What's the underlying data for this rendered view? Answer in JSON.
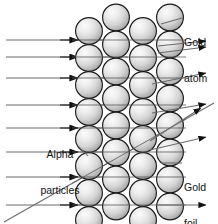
{
  "diagram": {
    "labels": {
      "gold_atom": {
        "line1": "Gold",
        "line2": "atom"
      },
      "gold_foil": {
        "line1": "Gold",
        "line2": "foil"
      },
      "alpha_particles": {
        "line1": "Alpha",
        "line2": "particles"
      }
    },
    "colors": {
      "sphere_outline": "#1a1a1a",
      "sphere_light": "#f2f2f2",
      "sphere_mid": "#d0d0d0",
      "sphere_dark": "#8f8f8f",
      "ray": "#6b6b6b",
      "arrowhead": "#111111",
      "text": "#111111",
      "background": "#ffffff"
    },
    "foil": {
      "columns": 4,
      "sphere_diameter": 27,
      "column_x_centers": [
        89,
        116,
        143,
        170
      ],
      "column_offset_rows": [
        0,
        1,
        0,
        1
      ],
      "row_spacing": 27,
      "first_row_center_y": 31
    },
    "incoming_rays": {
      "count": 8,
      "description": "horizontal alpha particle beams entering from the left",
      "y_positions": [
        40,
        57,
        78,
        105,
        128,
        152,
        177,
        205
      ],
      "x_start": 6,
      "x_end": 128,
      "arrowhead_x": 78
    },
    "outgoing_rays": {
      "count": 7,
      "description": "alpha particles exiting the foil, mostly undeflected with some deflected",
      "items": [
        {
          "name": "undeflected-top",
          "x1": 158,
          "y1": 46,
          "x2": 214,
          "y2": 41
        },
        {
          "name": "undeflected-upper",
          "x1": 158,
          "y1": 52,
          "x2": 214,
          "y2": 46
        },
        {
          "name": "deflected-slight-1",
          "x1": 158,
          "y1": 84,
          "x2": 214,
          "y2": 73
        },
        {
          "name": "deflected-slight-2",
          "x1": 158,
          "y1": 113,
          "x2": 214,
          "y2": 104
        },
        {
          "name": "deflected-upward",
          "x1": 154,
          "y1": 141,
          "x2": 214,
          "y2": 103
        },
        {
          "name": "deflected-slight-3",
          "x1": 154,
          "y1": 149,
          "x2": 214,
          "y2": 137
        },
        {
          "name": "undeflected-bottom",
          "x1": 158,
          "y1": 205,
          "x2": 214,
          "y2": 205
        }
      ]
    },
    "scattered_track": {
      "name": "large-angle-deflection-path",
      "description": "alpha particle entering bottom-left and deflected up through the foil",
      "x1": 4,
      "y1": 222,
      "x2": 214,
      "y2": 103
    },
    "leader_lines": [
      {
        "name": "gold-atom-leader",
        "x1": 160,
        "y1": 24,
        "x2": 183,
        "y2": 18
      },
      {
        "name": "gold-foil-leader",
        "x1": 160,
        "y1": 163,
        "x2": 183,
        "y2": 163
      },
      {
        "name": "alpha-particles-leader",
        "x1": 88,
        "y1": 155,
        "x2": 80,
        "y2": 148
      }
    ]
  }
}
